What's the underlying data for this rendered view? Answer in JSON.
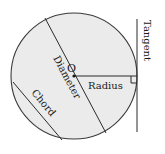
{
  "diagram": {
    "colors": {
      "fill": "#ebebeb",
      "stroke": "#2b2b2b",
      "text": "#1a1a1a"
    },
    "circle": {
      "cx": 74,
      "cy": 76,
      "r": 63
    },
    "center_label": "O",
    "labels": {
      "diameter": "Diameter",
      "radius": "Radius",
      "chord": "Chord",
      "tangent": "Tangent"
    },
    "segments": {
      "diameter": {
        "x1": 45,
        "y1": 18,
        "x2": 106,
        "y2": 133
      },
      "radius": {
        "x1": 74,
        "y1": 76,
        "x2": 137,
        "y2": 76
      },
      "chord": {
        "x1": 13,
        "y1": 82,
        "x2": 62,
        "y2": 140
      },
      "tangent": {
        "x1": 137,
        "y1": 19,
        "x2": 137,
        "y2": 132
      }
    },
    "right_angle_marker": {
      "x": 131,
      "y": 76,
      "size": 6
    }
  }
}
